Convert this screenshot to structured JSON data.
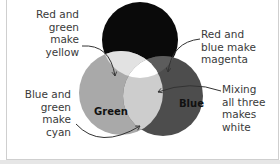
{
  "diagram": {
    "type": "venn",
    "circles": [
      {
        "name": "Red",
        "label": "Red",
        "fill": "#0a0a0a",
        "cx": 140,
        "cy": 40,
        "r": 38
      },
      {
        "name": "Green",
        "label": "Green",
        "fill": "#a9a9a9",
        "cx": 121,
        "cy": 93,
        "r": 42
      },
      {
        "name": "Blue",
        "label": "Blue",
        "fill": "#4d4d4d",
        "cx": 163,
        "cy": 96,
        "r": 40
      }
    ],
    "overlaps": {
      "red_green": "#e2e2e2",
      "red_blue": "#5b5b5b",
      "green_blue": "#cfcfcf",
      "all": "#ffffff"
    },
    "annotations": [
      {
        "id": "yellow",
        "lines": [
          "Red and",
          "green make",
          "yellow"
        ]
      },
      {
        "id": "magenta",
        "lines": [
          "Red and",
          "blue make",
          "magenta"
        ]
      },
      {
        "id": "cyan",
        "lines": [
          "Blue and",
          "green",
          "make cyan"
        ]
      },
      {
        "id": "white",
        "lines": [
          "Mixing",
          "all three",
          "makes",
          "white"
        ]
      }
    ]
  }
}
